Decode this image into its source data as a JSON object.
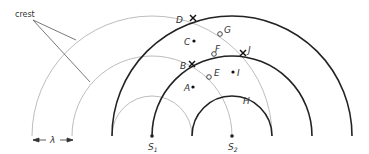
{
  "diagram": {
    "colors": {
      "source1_wavefront": "#bdbdbd",
      "source2_wavefront": "#222222",
      "annotation": "#555555"
    },
    "annotation": {
      "crest_label": "crest",
      "wavelength_label": "λ"
    },
    "sources": [
      {
        "name": "S1",
        "letter": "S",
        "subscript": "1",
        "x": 152,
        "y": 136
      },
      {
        "name": "S2",
        "letter": "S",
        "subscript": "2",
        "x": 232,
        "y": 136
      }
    ],
    "wavefronts": {
      "source1_radii": [
        40,
        80,
        120
      ],
      "source2_radii": [
        40,
        80,
        120
      ]
    },
    "points": [
      {
        "label": "D",
        "marker": "cross",
        "x": 193,
        "y": 18
      },
      {
        "label": "G",
        "marker": "open-circle",
        "x": 220,
        "y": 34
      },
      {
        "label": "C",
        "marker": "dot",
        "x": 194,
        "y": 41
      },
      {
        "label": "F",
        "marker": "open-circle",
        "x": 214,
        "y": 54
      },
      {
        "label": "J",
        "marker": "cross",
        "x": 243,
        "y": 53
      },
      {
        "label": "B",
        "marker": "cross",
        "x": 192,
        "y": 64
      },
      {
        "label": "E",
        "marker": "open-circle",
        "x": 209,
        "y": 77
      },
      {
        "label": "I",
        "marker": "dot",
        "x": 233,
        "y": 72
      },
      {
        "label": "A",
        "marker": "dot",
        "x": 193,
        "y": 87
      },
      {
        "label": "H",
        "marker": "none",
        "x": 247,
        "y": 99
      }
    ]
  }
}
